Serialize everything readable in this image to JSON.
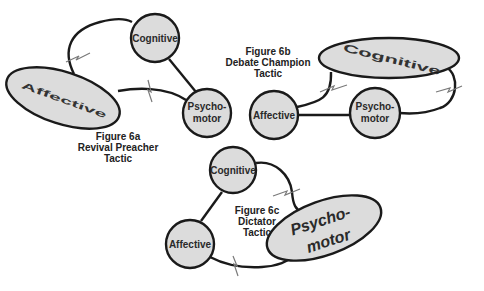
{
  "figures": [
    {
      "id": "6a",
      "caption": [
        "Figure 6a",
        "Revival Preacher",
        "Tactic"
      ],
      "dominant": "Affective",
      "nodes": {
        "cognitive": "Cognitive",
        "psychomotor_1": "Psycho-",
        "psychomotor_2": "motor",
        "affective": "Affective"
      }
    },
    {
      "id": "6b",
      "caption": [
        "Figure 6b",
        "Debate Champion",
        "Tactic"
      ],
      "dominant": "Cognitive",
      "nodes": {
        "cognitive": "Cognitive",
        "psychomotor_1": "Psycho-",
        "psychomotor_2": "motor",
        "affective": "Affective"
      }
    },
    {
      "id": "6c",
      "caption": [
        "Figure 6c",
        "Dictator",
        "Tactic"
      ],
      "dominant": "Psychomotor",
      "nodes": {
        "cognitive": "Cognitive",
        "psychomotor_1": "Psycho-",
        "psychomotor_2": "motor",
        "affective": "Affective"
      }
    }
  ],
  "colors": {
    "node_fill": "#dcdcdc",
    "stroke": "#1a1a1a",
    "background": "#ffffff"
  }
}
